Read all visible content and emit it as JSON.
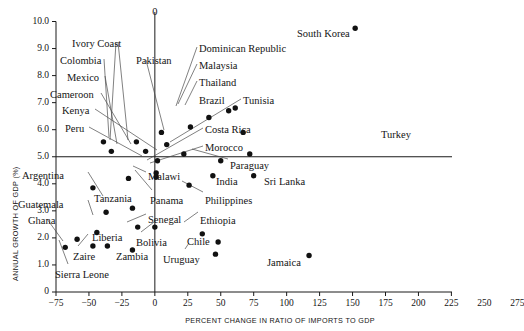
{
  "chart_data": {
    "type": "scatter",
    "title": "",
    "xlabel": "PERCENT CHANGE IN RATIO OF IMPORTS TO GDP",
    "ylabel": "ANNUAL GROWTH OF GDP (%)",
    "xlim": [
      -75,
      287
    ],
    "ylim": [
      0,
      10
    ],
    "grid": false,
    "legend": "none",
    "xticks": [
      "−75",
      "−50",
      "−25",
      "0",
      "25",
      "50",
      "75",
      "100",
      "125",
      "150",
      "175",
      "200",
      "225",
      "250",
      "275"
    ],
    "xtick_values": [
      -75,
      -50,
      -25,
      0,
      25,
      50,
      75,
      100,
      125,
      150,
      175,
      200,
      225,
      250,
      275
    ],
    "yticks": [
      "0",
      "1.0",
      "2.0",
      "3.0",
      "4.0",
      "5.0",
      "6.0",
      "7.0",
      "8.0",
      "9.0",
      "10.0"
    ],
    "ytick_values": [
      0,
      1,
      2,
      3,
      4,
      5,
      6,
      7,
      8,
      9,
      10
    ],
    "zero_line_label": "0",
    "reference_lines": [
      {
        "name": "vertical-zero-line",
        "x": 0
      },
      {
        "name": "horizontal-5pct-line",
        "y": 5.0
      }
    ],
    "points": [
      {
        "name": "South Korea",
        "x": 152,
        "y": 9.75
      },
      {
        "name": "Dominican Republic",
        "x": 61,
        "y": 6.8
      },
      {
        "name": "Malaysia",
        "x": 56,
        "y": 6.7
      },
      {
        "name": "Thailand",
        "x": 41,
        "y": 6.45
      },
      {
        "name": "Brazil",
        "x": 27,
        "y": 6.1
      },
      {
        "name": "Tunisia",
        "x": 67,
        "y": 5.9
      },
      {
        "name": "Pakistan",
        "x": 5,
        "y": 5.9
      },
      {
        "name": "Ivory Coast",
        "x": -14,
        "y": 5.55
      },
      {
        "name": "Colombia",
        "x": -39,
        "y": 5.55
      },
      {
        "name": "Mexico",
        "x": -33,
        "y": 5.2
      },
      {
        "name": "Cameroon",
        "x": -7,
        "y": 5.2
      },
      {
        "name": "Costa Rica",
        "x": 9,
        "y": 5.45
      },
      {
        "name": "Morocco",
        "x": 72,
        "y": 5.1
      },
      {
        "name": "Kenya",
        "x": 22,
        "y": 5.1
      },
      {
        "name": "Peru",
        "x": 2,
        "y": 4.85
      },
      {
        "name": "Paraguay",
        "x": 50,
        "y": 4.85
      },
      {
        "name": "India",
        "x": 44,
        "y": 4.3
      },
      {
        "name": "Sri Lanka",
        "x": 75,
        "y": 4.3
      },
      {
        "name": "Malawi",
        "x": 1,
        "y": 4.4
      },
      {
        "name": "Malawi B",
        "x": 1,
        "y": 4.25
      },
      {
        "name": "Argentina",
        "x": -20,
        "y": 4.2
      },
      {
        "name": "Philippines",
        "x": 26,
        "y": 3.95
      },
      {
        "name": "Guatemala",
        "x": -47,
        "y": 3.85
      },
      {
        "name": "Tanzania",
        "x": -17,
        "y": 3.1
      },
      {
        "name": "Panama",
        "x": -37,
        "y": 2.95
      },
      {
        "name": "Senegal",
        "x": -13,
        "y": 2.4
      },
      {
        "name": "Bolivia",
        "x": 0,
        "y": 2.4
      },
      {
        "name": "Ethiopia",
        "x": 36,
        "y": 2.15
      },
      {
        "name": "Liberia",
        "x": -44,
        "y": 2.2
      },
      {
        "name": "Ghana",
        "x": -59,
        "y": 1.95
      },
      {
        "name": "Chile",
        "x": 48,
        "y": 1.85
      },
      {
        "name": "Zaire",
        "x": -47,
        "y": 1.7
      },
      {
        "name": "Zambia",
        "x": -36,
        "y": 1.7
      },
      {
        "name": "Zambia B",
        "x": -17,
        "y": 1.55
      },
      {
        "name": "Uruguay",
        "x": 46,
        "y": 1.4
      },
      {
        "name": "Jamaica",
        "x": 117,
        "y": 1.35
      },
      {
        "name": "Sierra Leone",
        "x": -68,
        "y": 1.65
      },
      {
        "name": "Turkey",
        "x": 259,
        "y": 5.95
      }
    ],
    "annotations": [
      {
        "label": "Ivory Coast",
        "lx": 72,
        "ly": 39,
        "anchor": "start"
      },
      {
        "label": "Colombia",
        "lx": 60,
        "ly": 56,
        "anchor": "start"
      },
      {
        "label": "Mexico",
        "lx": 67,
        "ly": 73,
        "anchor": "start"
      },
      {
        "label": "Cameroon",
        "lx": 50,
        "ly": 90,
        "anchor": "start"
      },
      {
        "label": "Kenya",
        "lx": 62,
        "ly": 106,
        "anchor": "start"
      },
      {
        "label": "Peru",
        "lx": 65,
        "ly": 124,
        "anchor": "start"
      },
      {
        "label": "Pakistan",
        "lx": 136,
        "ly": 56,
        "anchor": "start"
      },
      {
        "label": "Dominican Republic",
        "lx": 199,
        "ly": 44,
        "anchor": "start"
      },
      {
        "label": "Malaysia",
        "lx": 199,
        "ly": 61,
        "anchor": "start"
      },
      {
        "label": "Thailand",
        "lx": 199,
        "ly": 78,
        "anchor": "start"
      },
      {
        "label": "Brazil",
        "lx": 199,
        "ly": 96,
        "anchor": "start"
      },
      {
        "label": "Tunisia",
        "lx": 243,
        "ly": 96,
        "anchor": "start"
      },
      {
        "label": "Costa Rica",
        "lx": 205,
        "ly": 125,
        "anchor": "start"
      },
      {
        "label": "Morocco",
        "lx": 205,
        "ly": 143,
        "anchor": "start"
      },
      {
        "label": "South Korea",
        "lx": 297,
        "ly": 29,
        "anchor": "start"
      },
      {
        "label": "Turkey",
        "lx": 381,
        "ly": 130,
        "anchor": "start"
      },
      {
        "label": "Paraguay",
        "lx": 230,
        "ly": 161,
        "anchor": "start"
      },
      {
        "label": "India",
        "lx": 216,
        "ly": 177,
        "anchor": "start"
      },
      {
        "label": "Sri Lanka",
        "lx": 264,
        "ly": 177,
        "anchor": "start"
      },
      {
        "label": "Malawi",
        "lx": 148,
        "ly": 172,
        "anchor": "start"
      },
      {
        "label": "Argentina",
        "lx": 22,
        "ly": 171,
        "anchor": "start"
      },
      {
        "label": "Guatemala",
        "lx": 18,
        "ly": 200,
        "anchor": "start"
      },
      {
        "label": "Tanzania",
        "lx": 94,
        "ly": 194,
        "anchor": "start"
      },
      {
        "label": "Panama",
        "lx": 150,
        "ly": 196,
        "anchor": "start"
      },
      {
        "label": "Philippines",
        "lx": 205,
        "ly": 196,
        "anchor": "start"
      },
      {
        "label": "Ghana",
        "lx": 28,
        "ly": 216,
        "anchor": "start"
      },
      {
        "label": "Senegal",
        "lx": 148,
        "ly": 215,
        "anchor": "start"
      },
      {
        "label": "Ethiopia",
        "lx": 200,
        "ly": 216,
        "anchor": "start"
      },
      {
        "label": "Liberia",
        "lx": 92,
        "ly": 233,
        "anchor": "start"
      },
      {
        "label": "Bolivia",
        "lx": 136,
        "ly": 238,
        "anchor": "start"
      },
      {
        "label": "Chile",
        "lx": 187,
        "ly": 237,
        "anchor": "start"
      },
      {
        "label": "Zaire",
        "lx": 73,
        "ly": 252,
        "anchor": "start"
      },
      {
        "label": "Zambia",
        "lx": 116,
        "ly": 252,
        "anchor": "start"
      },
      {
        "label": "Uruguay",
        "lx": 163,
        "ly": 255,
        "anchor": "start"
      },
      {
        "label": "Jamaica",
        "lx": 267,
        "ly": 258,
        "anchor": "start"
      },
      {
        "label": "Sierra Leone",
        "lx": 55,
        "ly": 270,
        "anchor": "start"
      }
    ],
    "leaders": [
      {
        "name": "ivory-coast-leader",
        "x1": 118,
        "y1": 42,
        "x2": 128,
        "y2": 140
      },
      {
        "name": "ivory-coast-leader-b",
        "x1": 116,
        "y1": 42,
        "x2": 110,
        "y2": 140
      },
      {
        "name": "colombia-leader",
        "x1": 104,
        "y1": 59,
        "x2": 109,
        "y2": 137
      },
      {
        "name": "mexico-leader",
        "x1": 105,
        "y1": 76,
        "x2": 117,
        "y2": 144
      },
      {
        "name": "cameroon-leader",
        "x1": 101,
        "y1": 93,
        "x2": 131,
        "y2": 144
      },
      {
        "name": "kenya-leader",
        "x1": 95,
        "y1": 109,
        "x2": 157,
        "y2": 150
      },
      {
        "name": "peru-leader",
        "x1": 89,
        "y1": 127,
        "x2": 142,
        "y2": 156
      },
      {
        "name": "pakistan-leader",
        "x1": 146,
        "y1": 60,
        "x2": 164,
        "y2": 130
      },
      {
        "name": "domrep-leader",
        "x1": 197,
        "y1": 47,
        "x2": 176,
        "y2": 106
      },
      {
        "name": "malaysia-leader",
        "x1": 197,
        "y1": 64,
        "x2": 178,
        "y2": 104
      },
      {
        "name": "thailand-leader",
        "x1": 197,
        "y1": 81,
        "x2": 185,
        "y2": 105
      },
      {
        "name": "tunisia-leader",
        "x1": 241,
        "y1": 99,
        "x2": 170,
        "y2": 142
      },
      {
        "name": "costarica-leader",
        "x1": 203,
        "y1": 128,
        "x2": 147,
        "y2": 160
      },
      {
        "name": "morocco-leader",
        "x1": 203,
        "y1": 146,
        "x2": 150,
        "y2": 163
      },
      {
        "name": "paraguay-leader",
        "x1": 228,
        "y1": 159,
        "x2": 192,
        "y2": 149
      },
      {
        "name": "malawi-leader",
        "x1": 146,
        "y1": 172,
        "x2": 133,
        "y2": 166
      },
      {
        "name": "argentina-leader",
        "x1": 88,
        "y1": 172,
        "x2": 103,
        "y2": 196
      },
      {
        "name": "guatemala-leader",
        "x1": 88,
        "y1": 200,
        "x2": 93,
        "y2": 215
      },
      {
        "name": "panama-leader",
        "x1": 152,
        "y1": 190,
        "x2": 135,
        "y2": 170
      },
      {
        "name": "philippines-leader",
        "x1": 203,
        "y1": 192,
        "x2": 182,
        "y2": 181
      },
      {
        "name": "ghana-leader",
        "x1": 47,
        "y1": 219,
        "x2": 63,
        "y2": 241
      },
      {
        "name": "senegal-leader",
        "x1": 146,
        "y1": 214,
        "x2": 127,
        "y2": 222
      },
      {
        "name": "ethiopia-leader",
        "x1": 198,
        "y1": 212,
        "x2": 184,
        "y2": 222
      },
      {
        "name": "sierraleone-leader",
        "x1": 68,
        "y1": 264,
        "x2": 59,
        "y2": 240
      },
      {
        "name": "zaire-leader",
        "x1": 78,
        "y1": 246,
        "x2": 88,
        "y2": 234
      },
      {
        "name": "bolivia-leader",
        "x1": 141,
        "y1": 232,
        "x2": 154,
        "y2": 222
      },
      {
        "name": "uruguay-leader",
        "x1": 185,
        "y1": 249,
        "x2": 189,
        "y2": 243
      }
    ]
  }
}
